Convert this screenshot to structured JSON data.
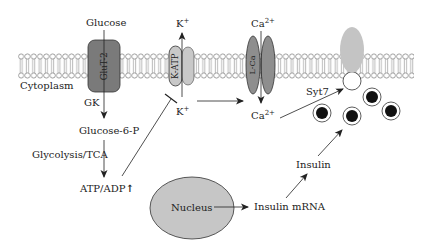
{
  "diagram": {
    "colors": {
      "membrane_line": "#777777",
      "glut2_fill": "#7a7a7a",
      "katp_fill": "#c8c8c8",
      "lca_fill": "#8e8e8e",
      "syt7_fill": "#c4c4c4",
      "nucleus_fill": "#c6c6c6",
      "vesicle_core": "#111111",
      "arrow": "#333333"
    },
    "labels": {
      "glucose": "Glucose",
      "glut2": "GluT-2",
      "cytoplasm": "Cytoplasm",
      "gk": "GK",
      "glucose6p": "Glucose-6-P",
      "glycolysis": "Glycolysis/TCA",
      "atp_adp": "ATP/ADP",
      "atp_adp_arrow": "↑",
      "katp": "K-ATP",
      "k_out": "K",
      "k_out_sup": "+",
      "k_in": "K",
      "k_in_sup": "+",
      "lca": "L-Ca",
      "ca_out": "Ca",
      "ca_out_sup": "2+",
      "ca_in": "Ca",
      "ca_in_sup": "2+",
      "syt7": "Syt7",
      "insulin": "Insulin",
      "insulin_mrna": "Insulin mRNA",
      "nucleus": "Nucleus"
    }
  }
}
